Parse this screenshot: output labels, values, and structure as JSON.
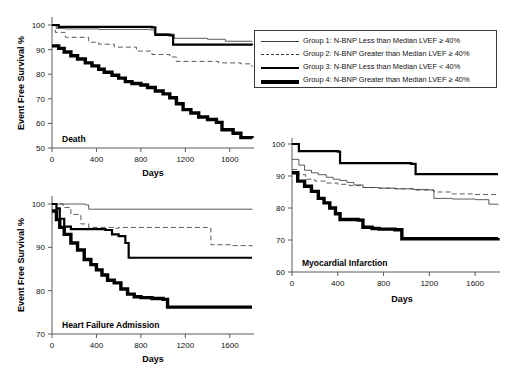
{
  "figure": {
    "y_axis_title": "Event Free Survival %",
    "x_axis_title": "Days"
  },
  "legend": {
    "items": [
      {
        "style": "thin-solid",
        "label": "Group 1: N-BNP Less than Median LVEF ≥ 40%"
      },
      {
        "style": "dashed",
        "label": "Group 2: N-BNP Greater than Median LVEF ≥ 40%"
      },
      {
        "style": "thick-solid",
        "label": "Group 3: N-BNP Less than Median LVEF < 40%"
      },
      {
        "style": "very-thick-solid",
        "label": "Group 4: N-BNP Greater than Median LVEF ≥ 40%"
      }
    ]
  },
  "chart_data": [
    {
      "type": "line",
      "title": "Death",
      "xlabel": "Days",
      "ylabel": "Event Free Survival %",
      "xlim": [
        0,
        1800
      ],
      "ylim": [
        50,
        100
      ],
      "xticks": [
        0,
        400,
        800,
        1200,
        1600
      ],
      "yticks": [
        50,
        60,
        70,
        80,
        90,
        100
      ],
      "grid": false,
      "legend_position": "outside-top-right",
      "series": [
        {
          "name": "Group 1: N-BNP Less than Median LVEF ≥ 40%",
          "style": "thin-solid",
          "points": [
            [
              0,
              100
            ],
            [
              40,
              98.6
            ],
            [
              120,
              98.4
            ],
            [
              420,
              98.2
            ],
            [
              880,
              98.0
            ],
            [
              920,
              96.5
            ],
            [
              1060,
              96.3
            ],
            [
              1100,
              94.6
            ],
            [
              1400,
              94.2
            ],
            [
              1560,
              93.4
            ],
            [
              1800,
              93.2
            ]
          ]
        },
        {
          "name": "Group 2: N-BNP Greater than Median LVEF ≥ 40%",
          "style": "dashed",
          "points": [
            [
              0,
              100
            ],
            [
              30,
              97.0
            ],
            [
              120,
              95.0
            ],
            [
              330,
              93.0
            ],
            [
              420,
              92.2
            ],
            [
              560,
              91.0
            ],
            [
              760,
              89.4
            ],
            [
              900,
              88.0
            ],
            [
              1060,
              87.0
            ],
            [
              1120,
              85.2
            ],
            [
              1500,
              84.6
            ],
            [
              1700,
              84.2
            ],
            [
              1800,
              83.0
            ]
          ]
        },
        {
          "name": "Group 3: N-BNP Less than Median LVEF < 40%",
          "style": "thick-solid",
          "points": [
            [
              0,
              100
            ],
            [
              60,
              99.2
            ],
            [
              900,
              99.0
            ],
            [
              930,
              96.0
            ],
            [
              1060,
              95.8
            ],
            [
              1090,
              92.0
            ],
            [
              1800,
              91.8
            ]
          ]
        },
        {
          "name": "Group 4: N-BNP Greater than Median LVEF ≥ 40%",
          "style": "very-thick-solid",
          "points": [
            [
              0,
              91.5
            ],
            [
              60,
              90.5
            ],
            [
              110,
              89.0
            ],
            [
              170,
              87.5
            ],
            [
              230,
              86.2
            ],
            [
              300,
              84.6
            ],
            [
              360,
              83.4
            ],
            [
              420,
              82.0
            ],
            [
              470,
              80.8
            ],
            [
              540,
              79.6
            ],
            [
              600,
              78.4
            ],
            [
              660,
              77.0
            ],
            [
              720,
              76.2
            ],
            [
              800,
              75.6
            ],
            [
              860,
              74.6
            ],
            [
              930,
              73.2
            ],
            [
              1000,
              72.0
            ],
            [
              1060,
              70.4
            ],
            [
              1120,
              68.0
            ],
            [
              1180,
              65.6
            ],
            [
              1250,
              64.2
            ],
            [
              1320,
              62.6
            ],
            [
              1400,
              61.6
            ],
            [
              1480,
              60.4
            ],
            [
              1530,
              57.4
            ],
            [
              1630,
              56.0
            ],
            [
              1700,
              54.2
            ],
            [
              1800,
              54.0
            ]
          ]
        }
      ]
    },
    {
      "type": "line",
      "title": "Heart Failure Admission",
      "xlabel": "Days",
      "ylabel": "Event Free Survival %",
      "xlim": [
        0,
        1800
      ],
      "ylim": [
        70,
        100
      ],
      "xticks": [
        0,
        400,
        800,
        1200,
        1600
      ],
      "yticks": [
        70,
        80,
        90,
        100
      ],
      "grid": false,
      "legend_position": "shared",
      "series": [
        {
          "name": "Group 1: N-BNP Less than Median LVEF ≥ 40%",
          "style": "thin-solid",
          "points": [
            [
              0,
              100
            ],
            [
              60,
              100
            ],
            [
              300,
              99.8
            ],
            [
              330,
              98.8
            ],
            [
              1800,
              98.6
            ]
          ]
        },
        {
          "name": "Group 2: N-BNP Greater than Median LVEF ≥ 40%",
          "style": "dashed",
          "points": [
            [
              0,
              100
            ],
            [
              100,
              99.2
            ],
            [
              170,
              97.6
            ],
            [
              260,
              95.4
            ],
            [
              330,
              94.6
            ],
            [
              560,
              94.4
            ],
            [
              600,
              94.6
            ],
            [
              1400,
              94.4
            ],
            [
              1430,
              90.6
            ],
            [
              1620,
              90.4
            ],
            [
              1800,
              90.2
            ]
          ]
        },
        {
          "name": "Group 3: N-BNP Less than Median LVEF < 40%",
          "style": "thick-solid",
          "points": [
            [
              0,
              100
            ],
            [
              40,
              99.0
            ],
            [
              70,
              96.6
            ],
            [
              110,
              94.8
            ],
            [
              170,
              94.2
            ],
            [
              480,
              94.0
            ],
            [
              540,
              93.0
            ],
            [
              600,
              92.6
            ],
            [
              660,
              91.0
            ],
            [
              690,
              87.6
            ],
            [
              1800,
              87.6
            ]
          ]
        },
        {
          "name": "Group 4: N-BNP Greater than Median LVEF ≥ 40%",
          "style": "very-thick-solid",
          "points": [
            [
              0,
              98.4
            ],
            [
              40,
              96.4
            ],
            [
              70,
              94.6
            ],
            [
              110,
              93.0
            ],
            [
              170,
              91.0
            ],
            [
              230,
              89.4
            ],
            [
              290,
              87.2
            ],
            [
              350,
              86.0
            ],
            [
              400,
              84.8
            ],
            [
              450,
              83.6
            ],
            [
              500,
              82.4
            ],
            [
              560,
              81.8
            ],
            [
              620,
              80.4
            ],
            [
              680,
              79.2
            ],
            [
              740,
              78.6
            ],
            [
              800,
              78.4
            ],
            [
              900,
              78.2
            ],
            [
              1000,
              78.0
            ],
            [
              1040,
              76.2
            ],
            [
              1800,
              76.2
            ]
          ]
        }
      ]
    },
    {
      "type": "line",
      "title": "Myocardial Infarction",
      "xlabel": "Days",
      "ylabel": "Event Free Survival %",
      "xlim": [
        0,
        1800
      ],
      "ylim": [
        60,
        100
      ],
      "xticks": [
        0,
        400,
        800,
        1200,
        1600
      ],
      "yticks": [
        60,
        70,
        80,
        90,
        100
      ],
      "grid": false,
      "legend_position": "shared",
      "series": [
        {
          "name": "Group 1: N-BNP Less than Median LVEF ≥ 40%",
          "style": "thin-solid",
          "points": [
            [
              0,
              95.2
            ],
            [
              60,
              93.4
            ],
            [
              110,
              91.8
            ],
            [
              170,
              91.0
            ],
            [
              230,
              90.4
            ],
            [
              300,
              89.6
            ],
            [
              360,
              89.0
            ],
            [
              420,
              88.6
            ],
            [
              480,
              88.0
            ],
            [
              540,
              87.2
            ],
            [
              620,
              86.4
            ],
            [
              760,
              86.2
            ],
            [
              900,
              86.0
            ],
            [
              1060,
              85.8
            ],
            [
              1200,
              85.6
            ],
            [
              1240,
              83.0
            ],
            [
              1400,
              82.8
            ],
            [
              1600,
              82.6
            ],
            [
              1720,
              81.2
            ],
            [
              1800,
              81.0
            ]
          ]
        },
        {
          "name": "Group 2: N-BNP Greater than Median LVEF ≥ 40%",
          "style": "dashed",
          "points": [
            [
              0,
              92.0
            ],
            [
              60,
              90.4
            ],
            [
              120,
              89.0
            ],
            [
              200,
              88.4
            ],
            [
              300,
              87.8
            ],
            [
              400,
              87.4
            ],
            [
              500,
              87.0
            ],
            [
              620,
              86.4
            ],
            [
              760,
              86.2
            ],
            [
              900,
              86.0
            ],
            [
              1060,
              85.6
            ],
            [
              1240,
              85.0
            ],
            [
              1400,
              84.4
            ],
            [
              1600,
              84.2
            ],
            [
              1800,
              84.0
            ]
          ]
        },
        {
          "name": "Group 3: N-BNP Less than Median LVEF < 40%",
          "style": "thick-solid",
          "points": [
            [
              0,
              100
            ],
            [
              60,
              97.8
            ],
            [
              400,
              97.6
            ],
            [
              420,
              94.0
            ],
            [
              1040,
              93.8
            ],
            [
              1080,
              90.6
            ],
            [
              1800,
              90.6
            ]
          ]
        },
        {
          "name": "Group 4: N-BNP Greater than Median LVEF ≥ 40%",
          "style": "very-thick-solid",
          "points": [
            [
              0,
              91.0
            ],
            [
              50,
              88.4
            ],
            [
              110,
              86.8
            ],
            [
              170,
              85.2
            ],
            [
              230,
              83.0
            ],
            [
              280,
              81.6
            ],
            [
              330,
              80.0
            ],
            [
              380,
              78.2
            ],
            [
              420,
              76.4
            ],
            [
              580,
              76.2
            ],
            [
              620,
              74.0
            ],
            [
              700,
              73.6
            ],
            [
              760,
              73.4
            ],
            [
              900,
              73.2
            ],
            [
              960,
              70.4
            ],
            [
              1200,
              70.4
            ],
            [
              1500,
              70.4
            ],
            [
              1800,
              70.6
            ]
          ]
        }
      ]
    }
  ]
}
